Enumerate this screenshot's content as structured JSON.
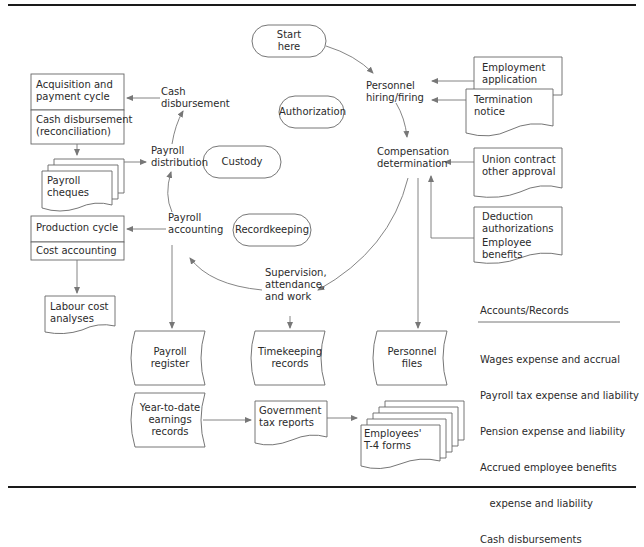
{
  "diagram": {
    "start": "Start\nhere",
    "controls": {
      "authorization": "Authorization",
      "custody": "Custody",
      "recordkeeping": "Recordkeeping"
    },
    "activities": {
      "personnel_hiring": [
        "Personnel",
        "hiring/firing"
      ],
      "compensation": [
        "Compensation",
        "determination"
      ],
      "supervision": [
        "Supervision,",
        "attendance,",
        "and work"
      ],
      "payroll_accounting": [
        "Payroll",
        "accounting"
      ],
      "payroll_distribution": [
        "Payroll",
        "distribution"
      ],
      "cash_disbursement": [
        "Cash",
        "disbursement"
      ]
    },
    "documents": {
      "employment_application": [
        "Employment",
        "application"
      ],
      "termination_notice": [
        "Termination",
        "notice"
      ],
      "union_contract": [
        "Union contract",
        "other approval"
      ],
      "deduction": [
        "Deduction",
        "authorizations"
      ],
      "employee_benefits": [
        "Employee",
        "benefits"
      ],
      "payroll_cheques": [
        "Payroll",
        "cheques"
      ],
      "labour_cost": [
        "Labour cost",
        "analyses"
      ],
      "government_tax": [
        "Government",
        "tax reports"
      ],
      "t4_forms": [
        "Employees'",
        "T-4 forms"
      ]
    },
    "cycles": {
      "acquisition": [
        "Acquisition and",
        "payment cycle"
      ],
      "cash_reconciliation": [
        "Cash disbursement",
        "(reconciliation)"
      ],
      "production": "Production cycle",
      "cost_accounting": "Cost accounting"
    },
    "files": {
      "payroll_register": [
        "Payroll",
        "register"
      ],
      "timekeeping": [
        "Timekeeping",
        "records"
      ],
      "personnel_files": [
        "Personnel",
        "files"
      ],
      "ytd_earnings": [
        "Year-to-date",
        "earnings",
        "records"
      ]
    },
    "accounts": {
      "title": "Accounts/Records",
      "items": [
        "Wages expense and accrual",
        "Payroll tax expense and liability",
        "Pension expense and liability",
        "Accrued employee benefits",
        "   expense and liability",
        "Cash disbursements"
      ]
    }
  }
}
